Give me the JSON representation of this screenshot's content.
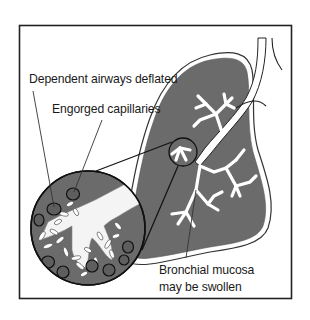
{
  "diagram": {
    "labels": {
      "dependent_airways": "Dependent airways deflated",
      "engorged_capillaries": "Engorged capillaries",
      "bronchial_mucosa_line1": "Bronchial mucosa",
      "bronchial_mucosa_line2": "may be swollen"
    },
    "colors": {
      "lung_fill": "#6b6b6b",
      "lung_outline": "#2a2a2a",
      "airway_fill": "#ffffff",
      "frame": "#222222",
      "capillary_fill": "#5e5e5e",
      "background": "#ffffff"
    }
  }
}
